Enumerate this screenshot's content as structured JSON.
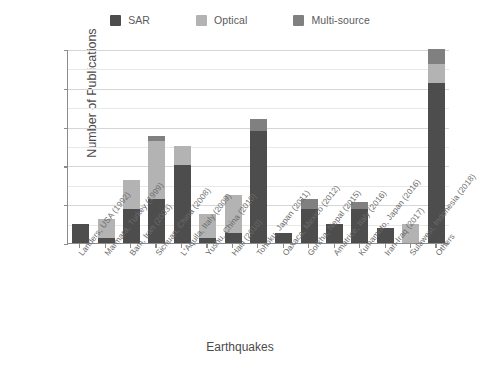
{
  "chart_data": {
    "type": "bar",
    "stacked": true,
    "title": "",
    "xlabel": "Earthquakes",
    "ylabel": "Number of Publications",
    "ylim": [
      0,
      40
    ],
    "yticks": [
      0,
      8,
      16,
      24,
      32,
      40
    ],
    "grid": true,
    "legend_position": "top-center",
    "colors": {
      "SAR": "#4d4d4d",
      "Optical": "#b3b3b3",
      "Multi-source": "#808080",
      "axis": "#8c8c8c",
      "grid": "#d6d6d6",
      "text": "#6b6b6b",
      "background": "#ffffff"
    },
    "categories": [
      "Landers, USA (1992)",
      "Marmara, Turkey (1999)",
      "Bam, Iran (2003)",
      "Sichuan, China (2008)",
      "L'Aquila, Italy (2009)",
      "Yushu, China (2010)",
      "Haiti (2010)",
      "Tohoku, Japan (2011)",
      "Oaxaca, Mexico (2012)",
      "Gorkha, Nepal (2015)",
      "Amatrice, Italy (2016)",
      "Kumamoto, Japan (2016)",
      "Iran-Iraq (2017)",
      "Sulawesi, Indonesia (2018)",
      "Others"
    ],
    "series": [
      {
        "name": "SAR",
        "color": "#4d4d4d",
        "values": [
          4,
          1,
          7,
          9,
          16,
          1,
          2,
          23,
          2,
          7,
          4,
          7,
          3,
          0,
          33
        ]
      },
      {
        "name": "Optical",
        "color": "#b3b3b3",
        "values": [
          0,
          4,
          6,
          12,
          4,
          5,
          8,
          0,
          0,
          0,
          0,
          0,
          0,
          4,
          4
        ]
      },
      {
        "name": "Multi-source",
        "color": "#808080",
        "values": [
          0,
          0,
          0,
          1,
          0,
          0,
          0,
          2.5,
          0,
          2,
          0,
          1.5,
          0,
          0,
          3
        ]
      }
    ],
    "totals": [
      4,
      5,
      13,
      22,
      20,
      6,
      10,
      25.5,
      2,
      9,
      4,
      8.5,
      3,
      4,
      40
    ]
  },
  "legend": {
    "entries": [
      {
        "label": "SAR",
        "color": "#4d4d4d"
      },
      {
        "label": "Optical",
        "color": "#b3b3b3"
      },
      {
        "label": "Multi-source",
        "color": "#808080"
      }
    ]
  }
}
